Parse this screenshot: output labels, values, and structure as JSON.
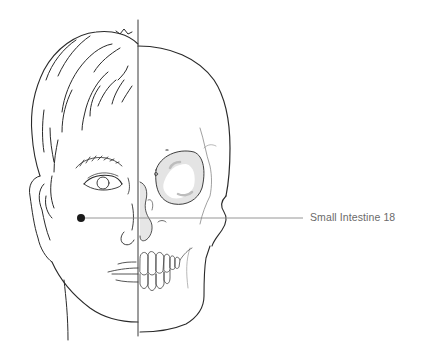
{
  "diagram": {
    "type": "anatomical-illustration",
    "left_half": "human face",
    "right_half": "skull",
    "point": {
      "label": "Small Intestine 18",
      "marker": "filled-dot",
      "position": "cheek, below cheekbone",
      "dot_color": "#1a1a1a",
      "leader_color": "#7a7a7a"
    },
    "colors": {
      "line": "#2a2a2a",
      "label_text": "#6a6a6a",
      "bone_shading": "#e2e2e2"
    }
  }
}
